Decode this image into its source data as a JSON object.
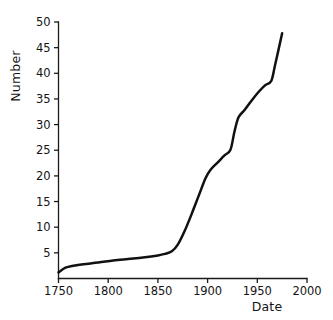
{
  "chart_data": {
    "type": "line",
    "title": "",
    "subtitle": "",
    "xlabel": "Date",
    "ylabel": "Number",
    "xlim": [
      1750,
      2000
    ],
    "ylim": [
      0,
      50
    ],
    "grid": false,
    "legend": null,
    "line_color": "#111111",
    "background_color": "#ffffff",
    "xticks": [
      1750,
      1800,
      1850,
      1900,
      1950,
      2000
    ],
    "xtick_labels": [
      "1750",
      "1800",
      "1850",
      "1900",
      "1950",
      "2000"
    ],
    "yticks": [
      5,
      10,
      15,
      20,
      25,
      30,
      35,
      40,
      45,
      50
    ],
    "ytick_labels": [
      "5",
      "10",
      "15",
      "20",
      "25",
      "30",
      "35",
      "40",
      "45",
      "50"
    ],
    "series": [
      {
        "name": "Number",
        "x": [
          1750,
          1757,
          1765,
          1775,
          1790,
          1805,
          1820,
          1835,
          1850,
          1857,
          1864,
          1870,
          1877,
          1884,
          1891,
          1898,
          1903,
          1910,
          1917,
          1923,
          1927,
          1931,
          1937,
          1944,
          1951,
          1958,
          1964,
          1968,
          1975
        ],
        "y": [
          1.2,
          2.1,
          2.5,
          2.8,
          3.1,
          3.5,
          3.8,
          4.1,
          4.5,
          4.8,
          5.3,
          6.6,
          9.3,
          12.6,
          16.1,
          19.6,
          21.2,
          22.6,
          24.0,
          25.1,
          28.6,
          31.4,
          32.8,
          34.6,
          36.3,
          37.7,
          38.5,
          41.7,
          47.8
        ]
      }
    ],
    "annotations": []
  },
  "labels": {
    "y_axis_title": "Number",
    "x_axis_title": "Date"
  }
}
